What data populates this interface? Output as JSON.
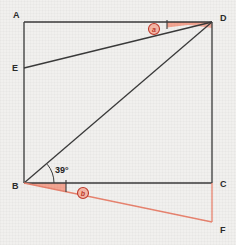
{
  "figure": {
    "background_color": "#f1f0ee",
    "line_color": "#3a3a3a",
    "accent_color": "#e8836f",
    "accent_fill": "#f2a08c",
    "marker_color": "#c0392b"
  },
  "vertices": [
    {
      "id": "A",
      "label": "A",
      "x": 24,
      "y": 22,
      "label_x": 13,
      "label_y": 18
    },
    {
      "id": "B",
      "label": "B",
      "x": 24,
      "y": 183,
      "label_x": 12,
      "label_y": 189
    },
    {
      "id": "C",
      "label": "C",
      "x": 212,
      "y": 183,
      "label_x": 220,
      "label_y": 187
    },
    {
      "id": "D",
      "label": "D",
      "x": 212,
      "y": 22,
      "label_x": 220,
      "label_y": 21
    },
    {
      "id": "E",
      "label": "E",
      "x": 24,
      "y": 68,
      "label_x": 12,
      "label_y": 71
    },
    {
      "id": "F",
      "label": "F",
      "x": 212,
      "y": 222,
      "label_x": 220,
      "label_y": 233
    }
  ],
  "segments": [
    {
      "name": "side-AD",
      "from": "A",
      "to": "D",
      "color": "#3a3a3a"
    },
    {
      "name": "side-AB",
      "from": "A",
      "to": "B",
      "color": "#3a3a3a"
    },
    {
      "name": "side-BC",
      "from": "B",
      "to": "C",
      "color": "#3a3a3a"
    },
    {
      "name": "side-CD",
      "from": "D",
      "to": "C",
      "color": "#3a3a3a"
    },
    {
      "name": "diagonal-BD",
      "from": "B",
      "to": "D",
      "color": "#3a3a3a"
    },
    {
      "name": "segment-ED",
      "from": "E",
      "to": "D",
      "color": "#3a3a3a"
    },
    {
      "name": "segment-BF",
      "from": "B",
      "to": "F",
      "color": "#e8836f"
    },
    {
      "name": "segment-CF",
      "from": "C",
      "to": "F",
      "color": "#e8836f"
    }
  ],
  "angles": [
    {
      "name": "angle-at-B-39",
      "vertex": "B",
      "label": "39°",
      "label_x": 55,
      "label_y": 173,
      "arc_radius": 30,
      "marked": true
    },
    {
      "name": "angle-marker-a-at-D",
      "vertex": "D",
      "glyph": "a",
      "circle_x": 154,
      "circle_y": 29,
      "circle_r": 5.5,
      "wedge": "between AD and ED at D"
    },
    {
      "name": "angle-marker-b-at-B",
      "vertex": "B",
      "glyph": "b",
      "circle_x": 83,
      "circle_y": 193,
      "circle_r": 5.5,
      "wedge": "between BC and BF at B"
    }
  ],
  "annotations": {
    "angle_value": "39°",
    "marker_a": "a",
    "marker_b": "b"
  }
}
